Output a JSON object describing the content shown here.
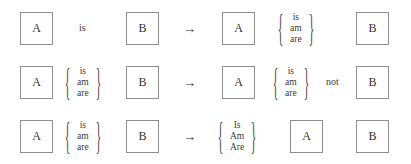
{
  "diagram": {
    "colors": {
      "background": "#ffffff",
      "box_border": "#8d8d8d",
      "text": "#3a3a3a",
      "arrow": "#2e2e2e"
    },
    "arrow_glyph": "→",
    "brace_left": "{",
    "brace_right": "}",
    "rows": [
      {
        "id": "rule-1",
        "left": {
          "box_a": "A",
          "word": "is",
          "box_b": "B"
        },
        "arrow": "→",
        "right": {
          "box_a": "A",
          "brace_words": [
            "is",
            "am",
            "are"
          ],
          "box_b": "B"
        }
      },
      {
        "id": "rule-2",
        "left": {
          "box_a": "A",
          "brace_words": [
            "is",
            "am",
            "are"
          ],
          "box_b": "B"
        },
        "arrow": "→",
        "right": {
          "box_a": "A",
          "brace_words": [
            "is",
            "am",
            "are"
          ],
          "word": "not",
          "box_b": "B"
        }
      },
      {
        "id": "rule-3",
        "left": {
          "box_a": "A",
          "brace_words": [
            "is",
            "am",
            "are"
          ],
          "box_b": "B"
        },
        "arrow": "→",
        "right": {
          "brace_words": [
            "Is",
            "Am",
            "Are"
          ],
          "box_a": "A",
          "box_b": "B"
        }
      }
    ]
  }
}
